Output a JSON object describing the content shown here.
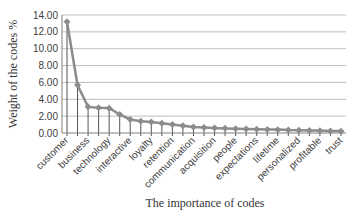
{
  "chart_data": {
    "type": "line",
    "title": "",
    "xlabel": "The importance of codes",
    "ylabel": "Weight of the codes %",
    "ylim": [
      0,
      14
    ],
    "yticks": [
      "0.00",
      "2.00",
      "4.00",
      "6.00",
      "8.00",
      "10.00",
      "12.00",
      "14.00"
    ],
    "grid": true,
    "legend": "none",
    "drop_lines": true,
    "line_color": "#8c8c8c",
    "marker": "diamond",
    "n_points": 27,
    "tick_labels": [
      "customer",
      "business",
      "technology",
      "interactive",
      "loyalty",
      "retention",
      "communication",
      "acquisition",
      "people",
      "expectations",
      "lifetime",
      "personalized",
      "profitable",
      "trust"
    ],
    "tick_label_every": 2,
    "values": [
      13.2,
      5.7,
      3.1,
      3.0,
      2.95,
      2.2,
      1.6,
      1.4,
      1.3,
      1.15,
      1.0,
      0.85,
      0.7,
      0.65,
      0.6,
      0.55,
      0.5,
      0.48,
      0.45,
      0.42,
      0.4,
      0.35,
      0.32,
      0.3,
      0.28,
      0.25,
      0.22
    ]
  }
}
